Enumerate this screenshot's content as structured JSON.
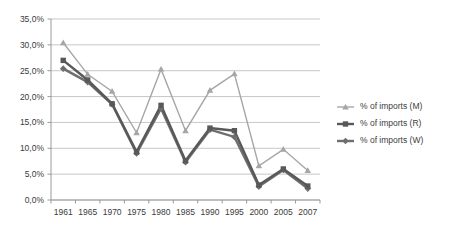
{
  "chart_data": {
    "type": "line",
    "title": "",
    "subtitle": "",
    "xlabel": "",
    "ylabel": "",
    "categories": [
      "1961",
      "1965",
      "1970",
      "1975",
      "1980",
      "1985",
      "1990",
      "1995",
      "2000",
      "2005",
      "2007"
    ],
    "ylim": [
      0,
      35
    ],
    "y_ticks": [
      "0,0%",
      "5,0%",
      "10,0%",
      "15,0%",
      "20,0%",
      "25,0%",
      "30,0%",
      "35,0%"
    ],
    "y_tick_values": [
      0,
      5,
      10,
      15,
      20,
      25,
      30,
      35
    ],
    "grid": true,
    "legend_position": "right",
    "series": [
      {
        "name": "% of imports (M)",
        "marker": "triangle",
        "color": "#a6a6a6",
        "values": [
          30.4,
          24.3,
          21.0,
          13.0,
          25.3,
          13.4,
          21.2,
          24.4,
          6.6,
          9.8,
          5.7
        ]
      },
      {
        "name": "% of imports (R)",
        "marker": "square",
        "color": "#595959",
        "values": [
          27.0,
          23.2,
          18.6,
          9.3,
          18.3,
          7.6,
          13.9,
          13.4,
          2.9,
          6.0,
          2.7
        ]
      },
      {
        "name": "% of imports (W)",
        "marker": "diamond",
        "color": "#6e6e6e",
        "values": [
          25.4,
          22.8,
          18.5,
          9.0,
          17.7,
          7.3,
          13.6,
          12.2,
          2.6,
          5.8,
          2.2
        ]
      }
    ]
  },
  "legend": {
    "entries": [
      {
        "label": "% of imports (M)"
      },
      {
        "label": "% of imports (R)"
      },
      {
        "label": "% of imports (W)"
      }
    ]
  },
  "colors": {
    "series_m": "#a6a6a6",
    "series_r": "#595959",
    "series_w": "#6e6e6e",
    "gridline": "#b9b9b9",
    "axis": "#9a9a9a",
    "text": "#3b3b3b",
    "background": "#ffffff"
  }
}
